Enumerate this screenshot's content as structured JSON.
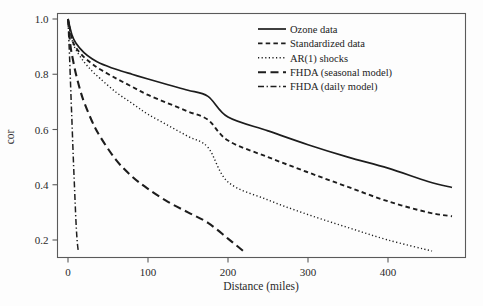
{
  "figure": {
    "background_color": "#fdfdfd",
    "frame_color": "#5a5a5a",
    "ink_color": "#1d1d1d"
  },
  "axes": {
    "x_title": "Distance (miles)",
    "y_title": "cor",
    "x_ticks": [
      "0",
      "100",
      "200",
      "300",
      "400"
    ],
    "y_ticks": [
      "1.0",
      "0.8",
      "0.6",
      "0.4",
      "0.2"
    ]
  },
  "legend": {
    "entries": [
      {
        "label": "Ozone data",
        "style": "solid"
      },
      {
        "label": "Standardized data",
        "style": "dashed"
      },
      {
        "label": "AR(1) shocks",
        "style": "dotted"
      },
      {
        "label": "FHDA (seasonal model)",
        "style": "longdash"
      },
      {
        "label": "FHDA (daily model)",
        "style": "dashdot"
      }
    ]
  },
  "chart_data": {
    "type": "line",
    "title": "",
    "xlabel": "Distance (miles)",
    "ylabel": "cor",
    "xlim": [
      0,
      480
    ],
    "ylim": [
      0.155,
      1.02
    ],
    "grid": false,
    "legend_position": "top-right-inside",
    "x_ticks": [
      0,
      100,
      200,
      300,
      400
    ],
    "y_ticks": [
      0.2,
      0.4,
      0.6,
      0.8,
      1.0
    ],
    "series": [
      {
        "name": "Ozone data",
        "style": "solid",
        "x": [
          0,
          5,
          10,
          20,
          30,
          40,
          60,
          80,
          100,
          125,
          150,
          175,
          200,
          250,
          300,
          350,
          400,
          450,
          480
        ],
        "y": [
          1.0,
          0.942,
          0.912,
          0.878,
          0.856,
          0.84,
          0.818,
          0.8,
          0.783,
          0.762,
          0.742,
          0.72,
          0.645,
          0.595,
          0.545,
          0.5,
          0.46,
          0.412,
          0.39
        ]
      },
      {
        "name": "Standardized data",
        "style": "dashed",
        "x": [
          0,
          5,
          10,
          20,
          30,
          40,
          60,
          80,
          100,
          125,
          150,
          175,
          200,
          250,
          300,
          350,
          400,
          450,
          480
        ],
        "y": [
          1.0,
          0.928,
          0.896,
          0.862,
          0.838,
          0.818,
          0.785,
          0.755,
          0.725,
          0.695,
          0.665,
          0.635,
          0.56,
          0.5,
          0.445,
          0.392,
          0.34,
          0.3,
          0.286
        ]
      },
      {
        "name": "AR(1) shocks",
        "style": "dotted",
        "x": [
          0,
          5,
          10,
          20,
          30,
          40,
          60,
          80,
          100,
          125,
          150,
          175,
          200,
          250,
          300,
          350,
          400,
          455
        ],
        "y": [
          1.0,
          0.925,
          0.888,
          0.845,
          0.812,
          0.785,
          0.735,
          0.695,
          0.655,
          0.615,
          0.575,
          0.535,
          0.41,
          0.345,
          0.292,
          0.245,
          0.2,
          0.16
        ]
      },
      {
        "name": "FHDA (seasonal model)",
        "style": "longdash",
        "x": [
          0,
          3,
          6,
          10,
          15,
          20,
          30,
          40,
          60,
          80,
          100,
          125,
          150,
          175,
          200,
          220
        ],
        "y": [
          1.0,
          0.905,
          0.855,
          0.8,
          0.745,
          0.7,
          0.63,
          0.575,
          0.49,
          0.43,
          0.385,
          0.338,
          0.3,
          0.262,
          0.205,
          0.158
        ]
      },
      {
        "name": "FHDA (daily model)",
        "style": "dashdot",
        "x": [
          0,
          1,
          2,
          3,
          4,
          5,
          6,
          7,
          8,
          9,
          10,
          11,
          12,
          13
        ],
        "y": [
          1.0,
          0.93,
          0.86,
          0.78,
          0.7,
          0.625,
          0.545,
          0.47,
          0.4,
          0.33,
          0.265,
          0.215,
          0.18,
          0.158
        ]
      }
    ]
  }
}
